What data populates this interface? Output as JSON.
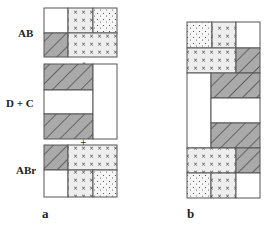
{
  "diagram": {
    "panel_a": {
      "caption": "a",
      "row_labels": {
        "top": "AB",
        "middle": "D + C",
        "bottom": "ABr"
      },
      "blocks": {
        "AB": [
          [
            "white",
            "crosses",
            "dots"
          ],
          [
            "hatched",
            "crosses",
            "crosses"
          ]
        ],
        "D + C": [
          [
            "hatched",
            "white"
          ],
          [
            "white",
            "white"
          ],
          [
            "hatched",
            "white"
          ]
        ],
        "ABr": [
          [
            "hatched",
            "crosses",
            "crosses"
          ],
          [
            "white",
            "crosses",
            "dots"
          ]
        ]
      }
    },
    "panel_b": {
      "caption": "b"
    },
    "legend_patterns": {
      "white": "#ffffff",
      "hatched": "#a9a9a9",
      "crosses": "#efefef",
      "dots": "#f6f6f6"
    }
  }
}
